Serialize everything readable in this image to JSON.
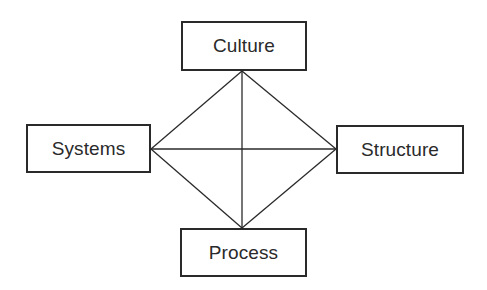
{
  "diagram": {
    "nodes": [
      {
        "id": "culture",
        "label": "Culture"
      },
      {
        "id": "systems",
        "label": "Systems"
      },
      {
        "id": "structure",
        "label": "Structure"
      },
      {
        "id": "process",
        "label": "Process"
      }
    ],
    "edges": [
      {
        "from": "culture",
        "to": "structure"
      },
      {
        "from": "structure",
        "to": "process"
      },
      {
        "from": "process",
        "to": "systems"
      },
      {
        "from": "systems",
        "to": "culture"
      },
      {
        "from": "culture",
        "to": "process"
      },
      {
        "from": "systems",
        "to": "structure"
      }
    ],
    "line_color": "#2a2a2a"
  }
}
